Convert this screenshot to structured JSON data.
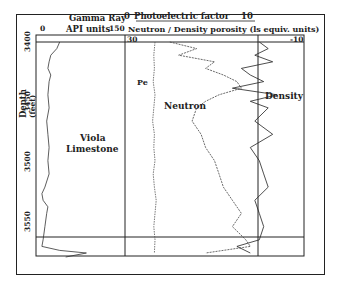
{
  "chart_data": {
    "type": "line",
    "title": "",
    "y_axis": {
      "label": "Depth",
      "units": "(feet)",
      "ticks": [
        3400,
        3450,
        3500,
        3550
      ],
      "range": [
        3400,
        3565
      ],
      "inverted": true
    },
    "tracks": [
      {
        "name": "Gamma Ray",
        "units": "API units",
        "scale_min": 0,
        "scale_max": 150,
        "series": [
          {
            "name": "Gamma Ray",
            "depth": [
              3400,
              3405,
              3410,
              3415,
              3420,
              3425,
              3430,
              3440,
              3450,
              3460,
              3470,
              3480,
              3490,
              3500,
              3510,
              3515,
              3520,
              3525,
              3530,
              3540,
              3550,
              3555,
              3558,
              3560,
              3563
            ],
            "values": [
              40,
              35,
              25,
              22,
              20,
              25,
              22,
              20,
              22,
              18,
              20,
              22,
              20,
              22,
              15,
              10,
              12,
              20,
              18,
              15,
              12,
              10,
              40,
              85,
              50
            ]
          }
        ]
      },
      {
        "name": "Neutron / Density porosity",
        "units": "(ls equiv. units)",
        "scale_min": 30,
        "scale_max": -10,
        "top_scale": {
          "name": "Photoelectric factor",
          "min": 0,
          "max": 10
        },
        "series": [
          {
            "name": "Pe",
            "depth": [
              3400,
              3410,
              3420,
              3430,
              3440,
              3450,
              3460,
              3470,
              3480,
              3490,
              3500,
              3510,
              3520,
              3530,
              3540,
              3550,
              3560
            ],
            "values": [
              5.0,
              4.8,
              4.9,
              4.7,
              5.0,
              4.8,
              4.6,
              4.9,
              4.8,
              5.0,
              4.7,
              4.9,
              5.2,
              5.0,
              4.8,
              5.0,
              4.9
            ]
          },
          {
            "name": "Neutron",
            "depth": [
              3400,
              3405,
              3410,
              3415,
              3420,
              3425,
              3430,
              3435,
              3440,
              3445,
              3450,
              3460,
              3470,
              3480,
              3490,
              3500,
              3510,
              3520,
              3530,
              3540,
              3550,
              3555,
              3560
            ],
            "values": [
              20,
              14,
              18,
              10,
              12,
              8,
              5,
              4,
              9,
              12,
              14,
              15,
              13,
              12,
              10,
              9,
              8,
              6,
              4,
              6,
              3,
              2,
              12
            ]
          },
          {
            "name": "Density",
            "depth": [
              3400,
              3405,
              3410,
              3415,
              3420,
              3425,
              3430,
              3435,
              3440,
              3445,
              3450,
              3460,
              3470,
              3480,
              3490,
              3500,
              3510,
              3520,
              3530,
              3540,
              3550,
              3555,
              3560
            ],
            "values": [
              0,
              -2,
              1,
              -3,
              4,
              2,
              -1,
              6,
              -4,
              2,
              -2,
              1,
              -3,
              2,
              0,
              -1,
              -2,
              1,
              0,
              -1,
              0,
              5,
              2
            ]
          }
        ],
        "zero_line": 0
      }
    ],
    "annotations": [
      "Viola Limestone",
      "Pe",
      "Neutron",
      "Density"
    ],
    "grid": false
  },
  "labels": {
    "gamma_title": "Gamma Ray",
    "gamma_units": "API units",
    "gamma_min": "0",
    "gamma_max": "150",
    "pe_min": "0",
    "pe_title": "Photoelectric factor",
    "pe_max": "10",
    "porosity_title": "Neutron / Density  porosity  (ls equiv. units)",
    "porosity_min": "30",
    "porosity_max": "-10",
    "depth_label": "Depth",
    "depth_units": "(feet)",
    "depth_3400": "3400",
    "depth_3450": "3450",
    "depth_3500": "3500",
    "depth_3550": "3550",
    "formation_line1": "Viola",
    "formation_line2": "Limestone",
    "pe_curve": "Pe",
    "neutron_curve": "Neutron",
    "density_curve": "Density"
  }
}
